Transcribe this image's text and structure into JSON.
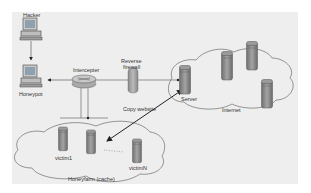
{
  "diagram": {
    "type": "network-architecture",
    "nodes": {
      "hacker": {
        "label": "Hacker"
      },
      "honeypot": {
        "label": "Honeypot"
      },
      "intercepter": {
        "label": "Intercepter"
      },
      "firewall": {
        "label": "Reverse firewall"
      },
      "server": {
        "label": "Server"
      },
      "victim1": {
        "label": "victim1"
      },
      "victimN": {
        "label": "victimN"
      }
    },
    "regions": {
      "internet": {
        "label": "Internet"
      },
      "honeyfarm": {
        "label": "Honeyfarm (cache)"
      }
    },
    "edges": {
      "copy": {
        "label": "Copy website"
      }
    },
    "colors": {
      "background": "#eeeeee",
      "stroke": "#555555",
      "server_body": "#8a8a8a",
      "arrow": "#222222"
    }
  }
}
